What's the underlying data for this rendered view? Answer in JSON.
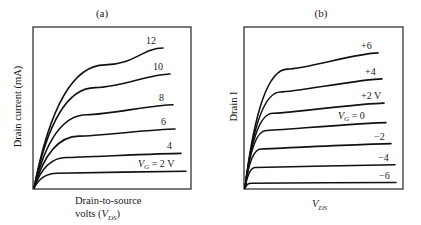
{
  "chart_data": [
    {
      "type": "line",
      "panel_label": "(a)",
      "title": "(a)",
      "xlabel_line1": "Drain-to-source",
      "xlabel_line2_prefix": "volts  (",
      "xlabel_var": "V",
      "xlabel_sub": "DS",
      "xlabel_line2_suffix": ")",
      "ylabel": "Drain current (mA)",
      "grid": false,
      "legend": "inline labels at curve ends",
      "series_param": "V_G (gate voltage)",
      "series": [
        {
          "name": "12",
          "label": "12",
          "end_y_frac": 0.87,
          "knee": 0.55
        },
        {
          "name": "10",
          "label": "10",
          "end_y_frac": 0.71,
          "knee": 0.45
        },
        {
          "name": "8",
          "label": "8",
          "end_y_frac": 0.52,
          "knee": 0.38
        },
        {
          "name": "6",
          "label": "6",
          "end_y_frac": 0.37,
          "knee": 0.32
        },
        {
          "name": "4",
          "label": "4",
          "end_y_frac": 0.22,
          "knee": 0.22
        },
        {
          "name": "2",
          "label_var": "V",
          "label_sub": "G",
          "label": " = 2 V",
          "end_y_frac": 0.11,
          "knee": 0.15
        }
      ]
    },
    {
      "type": "line",
      "panel_label": "(b)",
      "title": "(b)",
      "xlabel_var": "V",
      "xlabel_sub": "DS",
      "ylabel": "Drain I",
      "grid": false,
      "legend": "inline labels at curve ends",
      "series_param": "V_G (gate voltage)",
      "series": [
        {
          "name": "+6",
          "label": "+6",
          "end_y_frac": 0.84,
          "knee": 0.32
        },
        {
          "name": "+4",
          "label": "+4",
          "end_y_frac": 0.68,
          "knee": 0.26
        },
        {
          "name": "+2",
          "label": "+2 V",
          "end_y_frac": 0.53,
          "knee": 0.2
        },
        {
          "name": "0",
          "label_var": "V",
          "label_sub": "G",
          "label": " = 0",
          "end_y_frac": 0.41,
          "knee": 0.15
        },
        {
          "name": "-2",
          "label": "−2",
          "end_y_frac": 0.28,
          "knee": 0.11
        },
        {
          "name": "-4",
          "label": "−4",
          "end_y_frac": 0.15,
          "knee": 0.07
        },
        {
          "name": "-6",
          "label": "−6",
          "end_y_frac": 0.04,
          "knee": 0.04
        }
      ]
    }
  ]
}
